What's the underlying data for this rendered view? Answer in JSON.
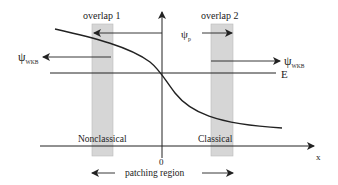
{
  "diagram": {
    "overlap1_label": "overlap 1",
    "overlap2_label": "overlap 2",
    "psi_p_main": "ψ",
    "psi_p_sub": "p",
    "psi_wkb_left_main": "ψ",
    "psi_wkb_left_sub": "WKB",
    "psi_wkb_right_main": "ψ",
    "psi_wkb_right_sub": "WKB",
    "energy_label": "E",
    "nonclassical_label": "Nonclassical",
    "classical_label": "Classical",
    "origin_label": "0",
    "x_axis_label": "x",
    "patching_label": "patching region"
  },
  "colors": {
    "line": "#222222",
    "band": "#d6d6d6",
    "band_border": "#b8b8b8"
  }
}
